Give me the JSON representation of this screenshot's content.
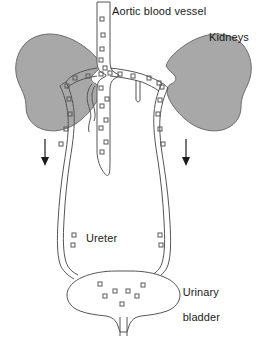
{
  "figure": {
    "type": "anatomical-line-diagram",
    "width": 268,
    "height": 339,
    "background_color": "#ffffff",
    "line_color": "#555555",
    "text_color": "#1b1b1b",
    "kidney_fill_color": "#a8a8a8",
    "kidney_stroke_color": "#6d6d6d",
    "marker_color": "#5a5a5a",
    "arrow_color": "#1b1b1b"
  },
  "labels": {
    "aorta": "Aortic blood vessel",
    "kidneys": "Kidneys",
    "ureter": "Ureter",
    "bladder_line1": "Urinary",
    "bladder_line2": "bladder"
  },
  "parts": [
    {
      "id": "aorta",
      "name": "Aortic blood vessel",
      "label": "Aortic blood vessel"
    },
    {
      "id": "kidney-left",
      "name": "Left kidney",
      "label": "Kidneys"
    },
    {
      "id": "kidney-right",
      "name": "Right kidney",
      "label": "Kidneys"
    },
    {
      "id": "ureter-left",
      "name": "Left ureter",
      "label": "Ureter"
    },
    {
      "id": "ureter-right",
      "name": "Right ureter",
      "label": "Ureter"
    },
    {
      "id": "bladder",
      "name": "Urinary bladder",
      "label": "Urinary bladder"
    },
    {
      "id": "urethra",
      "name": "Urethra",
      "label": ""
    }
  ],
  "flow_arrows": [
    {
      "id": "arrow-left",
      "direction": "down",
      "x": 45,
      "y_top": 139,
      "y_bottom": 165
    },
    {
      "id": "arrow-right",
      "direction": "down",
      "x": 186,
      "y_top": 139,
      "y_bottom": 165
    }
  ],
  "markers": {
    "shape": "small-square",
    "aorta_count": 18,
    "ureter_left_count": 6,
    "ureter_right_count": 6,
    "bladder_count": 8
  }
}
